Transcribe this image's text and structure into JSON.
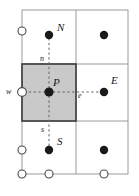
{
  "figure": {
    "type": "mesh-diagram",
    "width": 139,
    "height": 196,
    "colors": {
      "background": "#ffffff",
      "grid_line": "#9a9a9a",
      "cv_border": "#3c3c3c",
      "cv_fill": "#c9c9c9",
      "node_fill": "#1a1a1a",
      "boundary_node_fill": "#ffffff",
      "boundary_node_stroke": "#4a4a4a",
      "dashed_axis": "#555555",
      "label_text": "#1a1a1a"
    }
  },
  "grid": {
    "outer_bounds": {
      "x0": 22,
      "y0": 10,
      "x1": 128,
      "y1": 174
    },
    "vertical_lines_x": [
      22,
      76,
      128
    ],
    "horizontal_lines_y": [
      10,
      64,
      121,
      174
    ],
    "control_volume": {
      "x0": 22,
      "y0": 64,
      "x1": 76,
      "y1": 121
    }
  },
  "nodes": [
    {
      "id": "N",
      "label": "N",
      "cx": 49,
      "cy": 35,
      "r": 4.2,
      "kind": "interior",
      "label_x": 57,
      "label_y": 22,
      "size": "major"
    },
    {
      "id": "NE",
      "label": "",
      "cx": 104,
      "cy": 35,
      "r": 4.2,
      "kind": "interior",
      "label_x": 0,
      "label_y": 0,
      "size": "major"
    },
    {
      "id": "P",
      "label": "P",
      "cx": 49,
      "cy": 92,
      "r": 4.6,
      "kind": "interior",
      "label_x": 53,
      "label_y": 77,
      "size": "major"
    },
    {
      "id": "E",
      "label": "E",
      "cx": 104,
      "cy": 92,
      "r": 4.2,
      "kind": "interior",
      "label_x": 111,
      "label_y": 75,
      "size": "major"
    },
    {
      "id": "S",
      "label": "S",
      "cx": 49,
      "cy": 150,
      "r": 4.2,
      "kind": "interior",
      "label_x": 57,
      "label_y": 136,
      "size": "major"
    },
    {
      "id": "SE",
      "label": "",
      "cx": 104,
      "cy": 150,
      "r": 4.2,
      "kind": "interior",
      "label_x": 0,
      "label_y": 0,
      "size": "major"
    }
  ],
  "boundary_nodes": [
    {
      "id": "bw-top",
      "cx": 22,
      "cy": 31,
      "r": 4.0
    },
    {
      "id": "bw-mid",
      "cx": 22,
      "cy": 92,
      "r": 4.4
    },
    {
      "id": "bw-bottom",
      "cx": 22,
      "cy": 150,
      "r": 4.0
    },
    {
      "id": "bs-left",
      "cx": 22,
      "cy": 174,
      "r": 4.0
    },
    {
      "id": "bs-mid",
      "cx": 49,
      "cy": 174,
      "r": 4.0
    },
    {
      "id": "bs-right",
      "cx": 104,
      "cy": 174,
      "r": 4.0
    }
  ],
  "face_labels": [
    {
      "id": "n",
      "label": "n",
      "x": 40,
      "y": 55,
      "size": "minor"
    },
    {
      "id": "s",
      "label": "s",
      "x": 41,
      "y": 126,
      "size": "minor"
    },
    {
      "id": "w",
      "label": "w",
      "x": 6,
      "y": 88,
      "size": "minor"
    },
    {
      "id": "e",
      "label": "e",
      "x": 78,
      "y": 92,
      "size": "minor"
    }
  ],
  "dashed_axes": {
    "vertical": {
      "x": 49,
      "y_start": 38,
      "y_end": 147
    },
    "horizontal": {
      "y": 92,
      "x_start": 24,
      "x_end": 101
    }
  }
}
